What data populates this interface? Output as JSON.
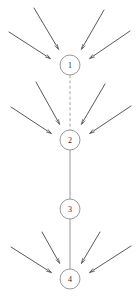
{
  "diagram": {
    "type": "directed-graph",
    "canvas": {
      "width": 138,
      "height": 303,
      "background": "#ffffff"
    },
    "style": {
      "node_stroke_color": "#8d8d8d",
      "node_fill_color": "#ffffff",
      "node_stroke_width": 0.9,
      "node_radius": 10,
      "node_label_color": "#2b2b2b",
      "node_label_size": 8,
      "chain_solid_color": "#8d8d8d",
      "chain_dashed_color": "#9a9a9a",
      "chain_stroke_width": 0.9,
      "dash_pattern": "3,2.4",
      "arrow_color": "#3a3a3a",
      "arrow_stroke_width": 0.85,
      "arrowhead_length": 6,
      "arrowhead_width": 3.4
    },
    "nodes": [
      {
        "id": "node-1",
        "label": "1",
        "cx": 70,
        "cy": 65,
        "r": 10
      },
      {
        "id": "node-2",
        "label": "2",
        "cx": 70,
        "cy": 140,
        "r": 10
      },
      {
        "id": "node-3",
        "label": "3",
        "cx": 70,
        "cy": 209,
        "r": 10
      },
      {
        "id": "node-4",
        "label": "4",
        "cx": 70,
        "cy": 279,
        "r": 10
      }
    ],
    "chain_links": [
      {
        "id": "link-1-2",
        "from": "node-1",
        "to": "node-2",
        "x1": 70,
        "y1": 75,
        "x2": 70,
        "y2": 130,
        "style": "dashed"
      },
      {
        "id": "link-2-3",
        "from": "node-2",
        "to": "node-3",
        "x1": 70,
        "y1": 150,
        "x2": 70,
        "y2": 199,
        "style": "solid"
      },
      {
        "id": "link-3-4",
        "from": "node-3",
        "to": "node-4",
        "x1": 70,
        "y1": 219,
        "x2": 70,
        "y2": 269,
        "style": "solid"
      }
    ],
    "incoming_arrows": [
      {
        "id": "arrow-1-a",
        "target": "node-1",
        "side": "left",
        "x1": 34,
        "y1": 8,
        "x2": 59,
        "y2": 50
      },
      {
        "id": "arrow-1-b",
        "target": "node-1",
        "side": "left",
        "x1": 9,
        "y1": 32,
        "x2": 51,
        "y2": 59
      },
      {
        "id": "arrow-1-c",
        "target": "node-1",
        "side": "right",
        "x1": 104,
        "y1": 10,
        "x2": 81,
        "y2": 50
      },
      {
        "id": "arrow-1-d",
        "target": "node-1",
        "side": "right",
        "x1": 130,
        "y1": 31,
        "x2": 89,
        "y2": 59
      },
      {
        "id": "arrow-2-a",
        "target": "node-2",
        "side": "left",
        "x1": 36,
        "y1": 82,
        "x2": 60,
        "y2": 125
      },
      {
        "id": "arrow-2-b",
        "target": "node-2",
        "side": "left",
        "x1": 11,
        "y1": 107,
        "x2": 52,
        "y2": 134
      },
      {
        "id": "arrow-2-c",
        "target": "node-2",
        "side": "right",
        "x1": 105,
        "y1": 84,
        "x2": 81,
        "y2": 125
      },
      {
        "id": "arrow-2-d",
        "target": "node-2",
        "side": "right",
        "x1": 131,
        "y1": 106,
        "x2": 89,
        "y2": 134
      },
      {
        "id": "arrow-4-a",
        "target": "node-4",
        "side": "left",
        "x1": 42,
        "y1": 232,
        "x2": 60,
        "y2": 264
      },
      {
        "id": "arrow-4-b",
        "target": "node-4",
        "side": "left",
        "x1": 11,
        "y1": 247,
        "x2": 52,
        "y2": 273
      },
      {
        "id": "arrow-4-c",
        "target": "node-4",
        "side": "right",
        "x1": 100,
        "y1": 232,
        "x2": 81,
        "y2": 264
      },
      {
        "id": "arrow-4-d",
        "target": "node-4",
        "side": "right",
        "x1": 131,
        "y1": 246,
        "x2": 89,
        "y2": 273
      }
    ]
  }
}
